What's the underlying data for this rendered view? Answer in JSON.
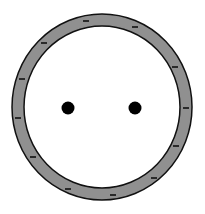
{
  "diagram": {
    "title": "Charged spherical shell with two interior point charges",
    "canvas": {
      "width": 205,
      "height": 214,
      "background": "#ffffff"
    },
    "shell": {
      "center": [
        102,
        107
      ],
      "outer_radius": [
        90,
        93
      ],
      "inner_radius": [
        78,
        81
      ],
      "fill": "#909090",
      "stroke": "#111111",
      "stroke_width": 1.5,
      "charge_sign": "-",
      "charge_marks": [
        {
          "x": 86,
          "y": 21
        },
        {
          "x": 135,
          "y": 27
        },
        {
          "x": 44,
          "y": 43
        },
        {
          "x": 175,
          "y": 67
        },
        {
          "x": 22,
          "y": 79
        },
        {
          "x": 18,
          "y": 118
        },
        {
          "x": 186,
          "y": 108
        },
        {
          "x": 33,
          "y": 157
        },
        {
          "x": 176,
          "y": 146
        },
        {
          "x": 154,
          "y": 178
        },
        {
          "x": 68,
          "y": 189
        },
        {
          "x": 113,
          "y": 195
        }
      ],
      "mark_color": "#111111",
      "mark_length": 6
    },
    "point_charges": [
      {
        "label": "left point charge",
        "x": 68,
        "y": 108,
        "r": 6.5,
        "color": "#000000"
      },
      {
        "label": "right point charge",
        "x": 135,
        "y": 108,
        "r": 6.5,
        "color": "#000000"
      }
    ]
  }
}
